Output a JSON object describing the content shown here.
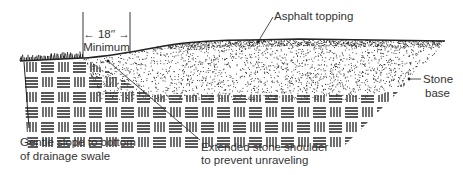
{
  "diagram": {
    "type": "cross-section",
    "labels": {
      "width_dimension": "← 18′′ →",
      "width_caption": "Minimum",
      "asphalt": "Asphalt topping",
      "stone_base_line1": "Stone",
      "stone_base_line2": "base",
      "slope_line1": "Gentle slope to bottom",
      "slope_line2": "of drainage swale",
      "shoulder_line1": "Extended stone shoulder",
      "shoulder_line2": "to prevent unraveling"
    },
    "layers": [
      {
        "name": "asphalt-topping",
        "pattern": "dense-stipple"
      },
      {
        "name": "stone-base",
        "pattern": "stipple"
      },
      {
        "name": "subsoil",
        "pattern": "basketweave-hatch"
      },
      {
        "name": "grass-verge",
        "pattern": "grass-tufts"
      }
    ],
    "colors": {
      "ink": "#222222",
      "text": "#333333",
      "background": "#ffffff"
    }
  }
}
